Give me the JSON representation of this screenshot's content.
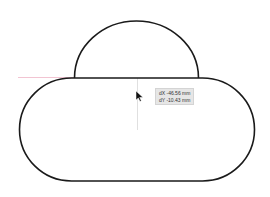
{
  "canvas": {
    "background": "#ffffff",
    "stroke_color": "#1a1a1a",
    "guide_color": "#f0b8c8",
    "shapes": [
      {
        "type": "semicircle",
        "name": "dome"
      },
      {
        "type": "rounded-rectangle",
        "name": "pill-base"
      }
    ]
  },
  "measure_tooltip": {
    "dx": "dX -46.56 mm",
    "dy": "dY -10.43 mm"
  },
  "cursor": {
    "icon": "arrow-cursor-icon"
  }
}
